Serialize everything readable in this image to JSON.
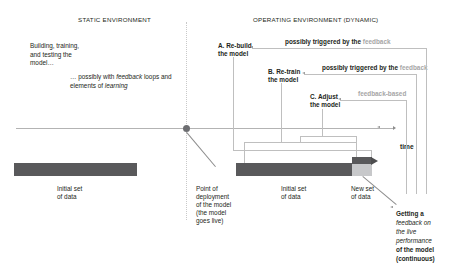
{
  "diagram": {
    "title_static": "STATIC ENVIRONMENT",
    "title_operating": "OPERATING ENVIRONMENT (DYNAMIC)",
    "static_env": {
      "building_note": "Building, training, and testing the model…",
      "feedback_note_prefix": "… possibly with ",
      "feedback_note_em1": "feedback",
      "feedback_note_mid": " loops and elements of ",
      "feedback_note_em2": "learning"
    },
    "steps": [
      {
        "id": "A",
        "label": "A. Re-build\nthe model",
        "line1": "A. Re-build",
        "line2": "the model"
      },
      {
        "id": "B",
        "label": "B. Re-train\nthe model",
        "line1": "B. Re-train",
        "line2": "the model"
      },
      {
        "id": "C",
        "label": "C. Adjust\nthe model",
        "line1": "C. Adjust",
        "line2": "the model"
      }
    ],
    "triggers": [
      {
        "text_bold": "possibly triggered by the ",
        "text_grey": "feedback"
      },
      {
        "text_bold": "possibly triggered by the ",
        "text_grey": "feedback"
      },
      {
        "text_bold": "",
        "text_grey": "feedback-based"
      }
    ],
    "axis": {
      "time_label": "time"
    },
    "bars": {
      "left_caption_l1": "Initial set",
      "left_caption_l2": "of data",
      "right_caption_l1": "Initial set",
      "right_caption_l2": "of data",
      "new_caption_l1": "New set",
      "new_caption_l2": "of data"
    },
    "annotations": {
      "deployment_l1": "Point of",
      "deployment_l2": "deployment",
      "deployment_l3": "of the model",
      "deployment_l4": "(the model",
      "deployment_l5": "goes live)",
      "feedback_l1": "Getting a",
      "feedback_l2": "feedback on",
      "feedback_l3": "the live",
      "feedback_l4": "performance",
      "feedback_l5": "of the model",
      "feedback_l6": "(continuous)"
    },
    "colors": {
      "bar_dark": "#59595b",
      "bar_light": "#c7c8ca",
      "line_grey": "#bfbfbf",
      "text": "#231f20",
      "muted_text": "#a6a6a6"
    }
  }
}
